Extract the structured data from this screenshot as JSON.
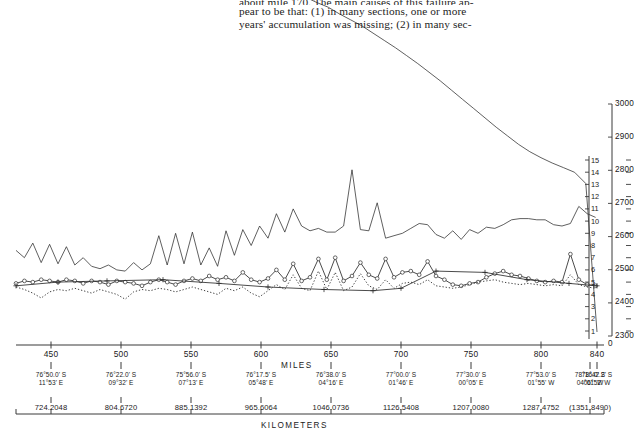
{
  "body_text": {
    "line1": "about mile 170. The main causes of this failure ap-",
    "line2": "pear to be that: (1) in many sections, one or more",
    "line3": "years' accumulation was missing; (2) in many sec-"
  },
  "axes": {
    "miles_label": "MILES",
    "kilometers_label": "KILOMETERS",
    "miles_ticks": [
      450,
      500,
      550,
      600,
      650,
      700,
      750,
      800,
      840
    ],
    "zero_label": "0",
    "inner_right_ticks": [
      1,
      2,
      3,
      4,
      5,
      6,
      7,
      8,
      9,
      10,
      11,
      12,
      13,
      14,
      15
    ],
    "outer_right_ticks": [
      2300,
      2400,
      2500,
      2600,
      2700,
      2800,
      2900,
      3000
    ],
    "left_inner_ticks": [
      1,
      2,
      3,
      4,
      5,
      6,
      7,
      8,
      9,
      10,
      11,
      12,
      13,
      14,
      15
    ],
    "x_range": [
      425,
      845
    ],
    "inner_y_range": [
      0,
      15
    ],
    "outer_y_range": [
      2300,
      3000
    ]
  },
  "coordinates": [
    {
      "lat": "76°50.0' S",
      "lon": "11°53' E",
      "mile": 450,
      "km": "724.2048"
    },
    {
      "lat": "76°22.0' S",
      "lon": "09°32' E",
      "mile": 500,
      "km": "804.6720"
    },
    {
      "lat": "75°56.0' S",
      "lon": "07°13' E",
      "mile": 550,
      "km": "885.1392"
    },
    {
      "lat": "76°17.5' S",
      "lon": "05°48' E",
      "mile": 600,
      "km": "965.6064"
    },
    {
      "lat": "76°38.0' S",
      "lon": "04°16' E",
      "mile": 650,
      "km": "1046.0736"
    },
    {
      "lat": "77°00.0' S",
      "lon": "01°46' E",
      "mile": 700,
      "km": "1126.5408"
    },
    {
      "lat": "77°30.0' S",
      "lon": "00°05' E",
      "mile": 750,
      "km": "1207.0080"
    },
    {
      "lat": "77°53.0' S",
      "lon": "01°55' W",
      "mile": 800,
      "km": "1287.4752"
    },
    {
      "lat": "78°16.0' S",
      "lon": "04°01' W",
      "mile": 835,
      "km": "(1351.8490)"
    },
    {
      "lat": "78°42.2' S",
      "lon": "06°52' W",
      "mile": 840,
      "km": ""
    }
  ],
  "chart_data": {
    "type": "line",
    "title": "",
    "xlabel": "MILES",
    "ylabel": "",
    "xlim": [
      425,
      845
    ],
    "grid": false,
    "legend": "none",
    "axis_notes": {
      "right_inner": "accumulation / temperature scale 1-15",
      "right_outer": "surface elevation, meters 2300-3000"
    },
    "series": [
      {
        "name": "surface-elevation",
        "style": "solid-thin",
        "y_axis": "outer_right_meters",
        "x": [
          425,
          432,
          440,
          448,
          456,
          464,
          472,
          480,
          488,
          496,
          504,
          512,
          520,
          528,
          536,
          544,
          552,
          560,
          568,
          576,
          584,
          592,
          600,
          608,
          616,
          624,
          632,
          640,
          648,
          656,
          664,
          672,
          680,
          688,
          696,
          704,
          712,
          720,
          728,
          736,
          744,
          752,
          760,
          768,
          776,
          784,
          792,
          800,
          808,
          816,
          824,
          832,
          840
        ],
        "values": [
          3492,
          3494,
          3490,
          3486,
          3488,
          3480,
          3470,
          3476,
          3474,
          3462,
          3456,
          3458,
          3450,
          3438,
          3430,
          3424,
          3420,
          3422,
          3418,
          3404,
          3392,
          3384,
          3372,
          3360,
          3350,
          3336,
          3322,
          3306,
          3292,
          3272,
          3254,
          3236,
          3214,
          3192,
          3170,
          3146,
          3122,
          3096,
          3070,
          3042,
          3014,
          2986,
          2958,
          2930,
          2904,
          2878,
          2856,
          2838,
          2822,
          2808,
          2794,
          2760,
          2312
        ]
      },
      {
        "name": "upper-zigzag-series",
        "style": "solid-thin",
        "y_axis": "inner_right_units",
        "x": [
          425,
          431,
          437,
          443,
          449,
          455,
          461,
          467,
          473,
          479,
          485,
          491,
          497,
          503,
          509,
          515,
          521,
          527,
          533,
          539,
          545,
          551,
          557,
          563,
          569,
          575,
          581,
          587,
          593,
          599,
          605,
          611,
          617,
          623,
          629,
          635,
          641,
          647,
          653,
          659,
          665,
          671,
          677,
          683,
          689,
          695,
          701,
          707,
          713,
          719,
          725,
          731,
          737,
          743,
          749,
          755,
          761,
          767,
          773,
          779,
          785,
          791,
          797,
          803,
          809,
          815,
          821,
          827,
          833,
          839
        ],
        "values": [
          7.6,
          7.0,
          8.2,
          6.6,
          8.1,
          6.5,
          7.9,
          6.4,
          7.0,
          6.3,
          6.1,
          6.4,
          6.0,
          5.9,
          6.6,
          6.0,
          6.5,
          8.8,
          6.4,
          9.0,
          6.5,
          9.1,
          6.4,
          7.8,
          6.3,
          9.2,
          7.2,
          9.3,
          8.0,
          9.6,
          8.6,
          10.6,
          9.1,
          11.0,
          9.6,
          9.2,
          9.4,
          9.1,
          9.1,
          9.6,
          14.2,
          9.3,
          9.2,
          11.5,
          8.6,
          8.8,
          9.0,
          9.4,
          9.8,
          9.7,
          8.9,
          8.6,
          9.2,
          8.5,
          9.3,
          9.0,
          9.5,
          9.4,
          9.7,
          10.1,
          10.2,
          10.2,
          10.1,
          10.1,
          9.7,
          9.6,
          9.8,
          11.2,
          10.6,
          10.3
        ]
      },
      {
        "name": "open-circle-series",
        "style": "solid-open-circles",
        "y_axis": "inner_right_units",
        "x": [
          425,
          431,
          437,
          443,
          449,
          455,
          461,
          467,
          473,
          479,
          485,
          491,
          497,
          503,
          509,
          515,
          521,
          527,
          533,
          539,
          545,
          551,
          557,
          563,
          569,
          575,
          581,
          587,
          593,
          599,
          605,
          611,
          617,
          623,
          629,
          635,
          641,
          647,
          653,
          659,
          665,
          671,
          677,
          683,
          689,
          695,
          701,
          707,
          713,
          719,
          725,
          731,
          737,
          743,
          749,
          755,
          761,
          767,
          773,
          779,
          785,
          791,
          797,
          803,
          809,
          815,
          821,
          827,
          833,
          839
        ],
        "values": [
          4.9,
          5.1,
          5.0,
          5.2,
          5.1,
          5.0,
          5.2,
          5.1,
          4.9,
          5.1,
          5.0,
          4.8,
          5.1,
          5.0,
          4.9,
          4.7,
          5.0,
          5.2,
          5.0,
          4.8,
          5.1,
          5.3,
          5.1,
          5.5,
          5.2,
          5.4,
          5.1,
          5.8,
          5.2,
          5.0,
          5.3,
          6.0,
          5.2,
          6.5,
          5.1,
          5.4,
          6.9,
          5.2,
          7.0,
          5.1,
          5.5,
          6.6,
          5.6,
          5.3,
          6.9,
          5.4,
          5.8,
          5.9,
          5.6,
          6.7,
          5.5,
          5.2,
          4.8,
          4.7,
          4.9,
          5.0,
          5.4,
          5.7,
          5.9,
          5.6,
          5.5,
          5.3,
          5.1,
          5.0,
          5.1,
          5.0,
          7.3,
          5.2,
          4.8,
          4.7
        ]
      },
      {
        "name": "dotted-series",
        "style": "dotted",
        "y_axis": "inner_right_units",
        "x": [
          425,
          431,
          437,
          443,
          449,
          455,
          461,
          467,
          473,
          479,
          485,
          491,
          497,
          503,
          509,
          515,
          521,
          527,
          533,
          539,
          545,
          551,
          557,
          563,
          569,
          575,
          581,
          587,
          593,
          599,
          605,
          611,
          617,
          623,
          629,
          635,
          641,
          647,
          653,
          659,
          665,
          671,
          677,
          683,
          689,
          695,
          701,
          707,
          713,
          719,
          725,
          731,
          737,
          743,
          749,
          755,
          761,
          767,
          773,
          779,
          785,
          791,
          797,
          803,
          809,
          815,
          821,
          827,
          833,
          839
        ],
        "values": [
          4.6,
          4.4,
          4.1,
          3.7,
          4.2,
          4.4,
          4.3,
          4.5,
          4.3,
          4.1,
          4.4,
          4.2,
          4.0,
          3.6,
          4.2,
          4.4,
          4.3,
          4.5,
          4.4,
          4.2,
          4.4,
          4.6,
          4.4,
          4.2,
          4.0,
          4.5,
          4.3,
          4.6,
          4.1,
          3.8,
          4.3,
          4.8,
          4.4,
          5.6,
          4.5,
          4.3,
          5.9,
          4.4,
          5.8,
          4.3,
          4.6,
          5.7,
          4.7,
          4.4,
          5.2,
          4.5,
          4.9,
          5.0,
          4.8,
          5.2,
          4.7,
          4.6,
          4.5,
          4.6,
          4.8,
          5.0,
          5.1,
          5.2,
          5.0,
          4.9,
          4.8,
          4.9,
          4.8,
          4.7,
          4.8,
          4.7,
          5.6,
          4.8,
          4.6,
          4.5
        ]
      },
      {
        "name": "plus-marker-trend",
        "style": "solid-plus-markers",
        "y_axis": "inner_right_units",
        "x": [
          425,
          455,
          490,
          530,
          570,
          605,
          645,
          680,
          700,
          725,
          760,
          790,
          820,
          840
        ],
        "values": [
          4.7,
          5.0,
          5.1,
          5.2,
          4.9,
          4.6,
          4.4,
          4.3,
          4.5,
          5.9,
          5.8,
          5.2,
          4.9,
          4.7
        ]
      }
    ]
  }
}
